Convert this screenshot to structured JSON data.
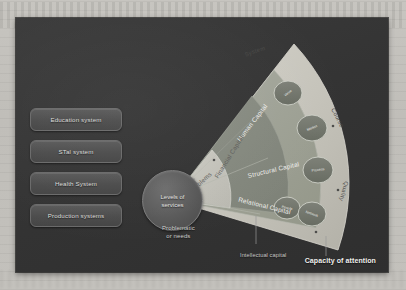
{
  "slide": {
    "title_caption": "Capacity of attention",
    "hub": {
      "line1": "Levels of",
      "line2": "services"
    },
    "systems": [
      {
        "label": "Education system"
      },
      {
        "label": "STal system"
      },
      {
        "label": "Health System"
      },
      {
        "label": "Production systems"
      }
    ],
    "band_labels": {
      "problems": "Problems",
      "financial_capital": "Financial Capital"
    },
    "capitals": [
      {
        "label": "Human Capital"
      },
      {
        "label": "Structural Capital"
      },
      {
        "label": "Relational Capital"
      }
    ],
    "arc_labels": [
      {
        "label": "System"
      },
      {
        "label": "Course"
      },
      {
        "label": "Quality"
      }
    ],
    "outer_nodes": [
      {
        "label": "Value"
      },
      {
        "label": "Market"
      },
      {
        "label": "Process"
      },
      {
        "label": "People"
      },
      {
        "label": "Network"
      }
    ],
    "callouts": {
      "problematic_line1": "Problematic",
      "problematic_line2": "or needs",
      "intellectual_capital": "Intellectual capital"
    },
    "colors": {
      "slide_background": "#343434",
      "fan_outer": "#c9c7bf",
      "fan_mid": "#8f9289",
      "fan_inner": "#6f7a72",
      "box_fill": "#4c4c4c",
      "hub_fill": "#555555",
      "text_light": "#dcdcda"
    }
  }
}
